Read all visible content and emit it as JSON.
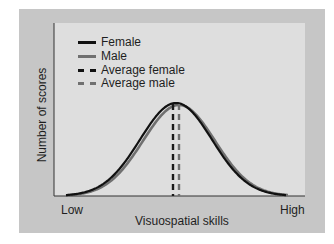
{
  "chart_data": {
    "type": "line",
    "title": "",
    "xlabel": "Visuospatial skills",
    "ylabel": "Number of scores",
    "x_ticks": [
      "Low",
      "High"
    ],
    "grid": false,
    "legend_position": "upper-left",
    "legend": [
      "Female",
      "Male",
      "Average female",
      "Average male"
    ],
    "series": [
      {
        "name": "Female",
        "style": "solid",
        "color": "#111111",
        "distribution": "normal",
        "mean_relative": 0.49,
        "peak_relative": 0.54
      },
      {
        "name": "Male",
        "style": "solid",
        "color": "#707070",
        "distribution": "normal",
        "mean_relative": 0.5,
        "peak_relative": 0.53
      },
      {
        "name": "Average female",
        "style": "dashed",
        "color": "#111111",
        "x_relative": 0.47
      },
      {
        "name": "Average male",
        "style": "dashed",
        "color": "#707070",
        "x_relative": 0.5
      }
    ],
    "annotations": []
  },
  "legend": {
    "items": [
      {
        "label": "Female"
      },
      {
        "label": "Male"
      },
      {
        "label": "Average female"
      },
      {
        "label": "Average male"
      }
    ]
  },
  "axes": {
    "x_title": "Visuospatial skills",
    "y_title": "Number of scores",
    "x_low": "Low",
    "x_high": "High"
  },
  "colors": {
    "panel": "#c6c6c6",
    "plot": "#dedede",
    "female": "#111111",
    "male": "#707070"
  }
}
